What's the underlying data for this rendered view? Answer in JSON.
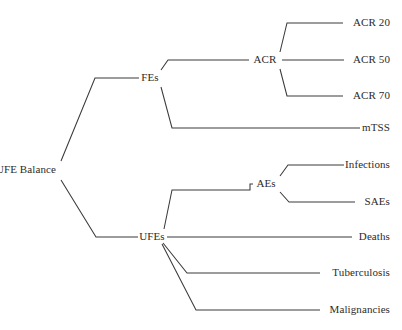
{
  "diagram": {
    "title": "FE/UFE Balance",
    "type": "tree",
    "orientation": "left-to-right",
    "line_color": "#3a3a3a",
    "text_color": "#2b2b2b",
    "background_color": "#ffffff",
    "nodes": {
      "root": {
        "label": "FE/UFE Balance",
        "x": 56,
        "y": 170,
        "anchor": "end"
      },
      "fes": {
        "label": "FEs",
        "x": 150,
        "y": 78,
        "anchor": "middle"
      },
      "ufes": {
        "label": "UFEs",
        "x": 152,
        "y": 237,
        "anchor": "middle"
      },
      "acr": {
        "label": "ACR",
        "x": 265,
        "y": 60,
        "anchor": "middle"
      },
      "aes": {
        "label": "AEs",
        "x": 266,
        "y": 184,
        "anchor": "middle"
      },
      "acr20": {
        "label": "ACR 20",
        "x": 390,
        "y": 23,
        "anchor": "end"
      },
      "acr50": {
        "label": "ACR 50",
        "x": 390,
        "y": 60,
        "anchor": "end"
      },
      "acr70": {
        "label": "ACR 70",
        "x": 390,
        "y": 96,
        "anchor": "end"
      },
      "mtss": {
        "label": "mTSS",
        "x": 390,
        "y": 128,
        "anchor": "end"
      },
      "infections": {
        "label": "Infections",
        "x": 390,
        "y": 165,
        "anchor": "end"
      },
      "saes": {
        "label": "SAEs",
        "x": 390,
        "y": 202,
        "anchor": "end"
      },
      "deaths": {
        "label": "Deaths",
        "x": 390,
        "y": 237,
        "anchor": "end"
      },
      "tuberculosis": {
        "label": "Tuberculosis",
        "x": 390,
        "y": 273,
        "anchor": "end"
      },
      "malignancies": {
        "label": "Malignancies",
        "x": 390,
        "y": 310,
        "anchor": "end"
      }
    },
    "edges": {
      "root_to_fes": "M 61,161 L 95,78 L 139,78",
      "root_to_ufes": "M 61,180 L 96,237 L 138,237",
      "fes_to_acr": "M 161,70 L 168,60 L 249,60",
      "fes_to_mtss": "M 161,87 L 172,128 L 360,128",
      "acr_to_acr20": "M 280,52 L 287,23 L 343,23",
      "acr_to_acr50": "M 282,60 L 344,60",
      "acr_to_acr70": "M 280,69 L 287,96 L 343,96",
      "ufes_to_aes": "M 164,229 L 172,190 L 250,190 L 250,184 L 253,184",
      "ufes_to_deaths": "M 167,237 L 352,237",
      "ufes_to_tuberculosis": "M 163,243 L 187,273 L 320,273",
      "ufes_to_malignancies": "M 162,244 L 196,310 L 320,310",
      "aes_to_infections": "M 280,176 L 288,165 L 344,165",
      "aes_to_saes": "M 280,192 L 289,202 L 355,202"
    }
  }
}
